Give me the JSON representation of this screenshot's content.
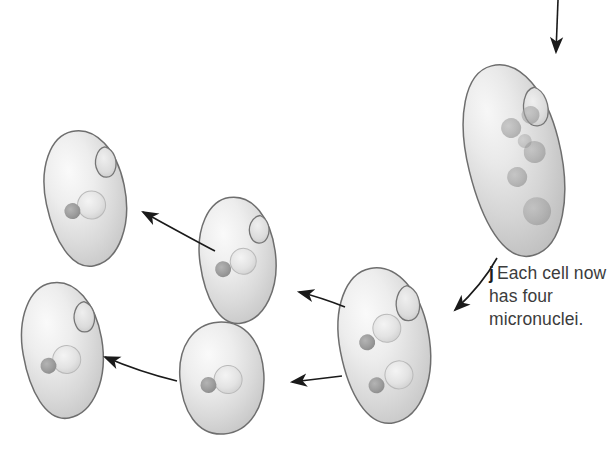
{
  "figure": {
    "background_color": "#ffffff",
    "width": 611,
    "height": 455
  },
  "caption": {
    "label": "j",
    "text": "Each cell now has four micronuclei.",
    "color": "#3c3c3c",
    "label_color": "#1d1d1d"
  },
  "palette": {
    "cell_fill_light": "#f2f2f2",
    "cell_fill_mid": "#dcdcdc",
    "cell_fill_dark": "#c2c2c2",
    "cell_outline": "#6e6e6e",
    "micronucleus": "#9a9a9a",
    "macronucleus": "#e4e4e4",
    "arrow": "#1a1a1a"
  },
  "cells": [
    {
      "id": "parent-cell",
      "name": "parent-cell-four-micronuclei",
      "cx": 515,
      "cy": 160,
      "rx": 47,
      "ry": 97,
      "rotation": -14,
      "has_oral_groove": true,
      "micronuclei_count": 6,
      "macronuclei_count": 0
    },
    {
      "id": "dividing-cell",
      "name": "dividing-cell-center",
      "cx": 385,
      "cy": 345,
      "rx": 45,
      "ry": 78,
      "rotation": -11,
      "has_oral_groove": true,
      "micronuclei_count": 2,
      "macronuclei_count": 2
    },
    {
      "id": "daughter-upper-left",
      "name": "daughter-cell-upper-left",
      "cx": 86,
      "cy": 198,
      "rx": 40,
      "ry": 68,
      "rotation": -12,
      "has_oral_groove": true,
      "micronuclei_count": 1,
      "macronuclei_count": 1
    },
    {
      "id": "daughter-upper-middle",
      "name": "daughter-cell-upper-middle",
      "cx": 238,
      "cy": 260,
      "rx": 38,
      "ry": 63,
      "rotation": -8,
      "has_oral_groove": true,
      "micronuclei_count": 1,
      "macronuclei_count": 1
    },
    {
      "id": "daughter-lower-left",
      "name": "daughter-cell-lower-left",
      "cx": 63,
      "cy": 350,
      "rx": 40,
      "ry": 68,
      "rotation": -10,
      "has_oral_groove": true,
      "micronuclei_count": 1,
      "macronuclei_count": 1
    },
    {
      "id": "daughter-lower-middle",
      "name": "daughter-cell-lower-middle",
      "cx": 222,
      "cy": 378,
      "rx": 42,
      "ry": 56,
      "rotation": -4,
      "has_oral_groove": false,
      "micronuclei_count": 1,
      "macronuclei_count": 1
    }
  ],
  "arrows": [
    {
      "id": "arrow-top-entry",
      "name": "arrow-into-parent-cell",
      "from": "top-edge",
      "to": "parent-cell"
    },
    {
      "id": "arrow-parent-to-dividing",
      "name": "arrow-parent-to-dividing-cell",
      "from": "parent-cell",
      "to": "dividing-cell"
    },
    {
      "id": "arrow-dividing-to-upper-middle",
      "name": "arrow-dividing-to-upper-middle",
      "from": "dividing-cell",
      "to": "daughter-upper-middle"
    },
    {
      "id": "arrow-upper-middle-to-upper-left",
      "name": "arrow-upper-middle-to-upper-left",
      "from": "daughter-upper-middle",
      "to": "daughter-upper-left"
    },
    {
      "id": "arrow-dividing-to-lower-middle",
      "name": "arrow-dividing-to-lower-middle",
      "from": "dividing-cell",
      "to": "daughter-lower-middle"
    },
    {
      "id": "arrow-lower-middle-to-lower-left",
      "name": "arrow-lower-middle-to-lower-left",
      "from": "daughter-lower-middle",
      "to": "daughter-lower-left"
    }
  ]
}
